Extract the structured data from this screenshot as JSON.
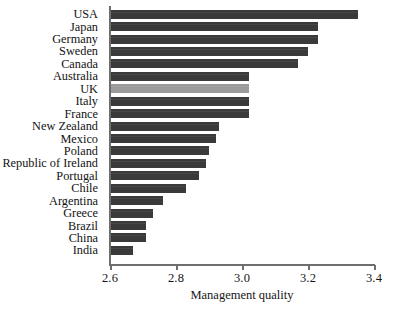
{
  "chart_data": {
    "type": "bar",
    "orientation": "horizontal",
    "title": "",
    "subtitle": "",
    "xlabel": "Management quality",
    "ylabel": "",
    "xlim": [
      2.6,
      3.4
    ],
    "xticks": [
      "2.6",
      "2.8",
      "3.0",
      "3.2",
      "3.4"
    ],
    "xtick_values": [
      2.6,
      2.8,
      3.0,
      3.2,
      3.4
    ],
    "grid": false,
    "legend": "none",
    "bar_color": "#3a3a3a",
    "highlight_color": "#9b9b9b",
    "highlight_category": "UK",
    "axis_color": "#6e6e6e",
    "background_color": "#ffffff",
    "categories": [
      "USA",
      "Japan",
      "Germany",
      "Sweden",
      "Canada",
      "Australia",
      "UK",
      "Italy",
      "France",
      "New Zealand",
      "Mexico",
      "Poland",
      "Republic of Ireland",
      "Portugal",
      "Chile",
      "Argentina",
      "Greece",
      "Brazil",
      "China",
      "India"
    ],
    "values": [
      3.35,
      3.23,
      3.23,
      3.2,
      3.17,
      3.02,
      3.02,
      3.02,
      3.02,
      2.93,
      2.92,
      2.9,
      2.89,
      2.87,
      2.83,
      2.76,
      2.73,
      2.71,
      2.71,
      2.67
    ],
    "bars": [
      {
        "label": "USA",
        "value": 3.35,
        "highlight": false
      },
      {
        "label": "Japan",
        "value": 3.23,
        "highlight": false
      },
      {
        "label": "Germany",
        "value": 3.23,
        "highlight": false
      },
      {
        "label": "Sweden",
        "value": 3.2,
        "highlight": false
      },
      {
        "label": "Canada",
        "value": 3.17,
        "highlight": false
      },
      {
        "label": "Australia",
        "value": 3.02,
        "highlight": false
      },
      {
        "label": "UK",
        "value": 3.02,
        "highlight": true
      },
      {
        "label": "Italy",
        "value": 3.02,
        "highlight": false
      },
      {
        "label": "France",
        "value": 3.02,
        "highlight": false
      },
      {
        "label": "New Zealand",
        "value": 2.93,
        "highlight": false
      },
      {
        "label": "Mexico",
        "value": 2.92,
        "highlight": false
      },
      {
        "label": "Poland",
        "value": 2.9,
        "highlight": false
      },
      {
        "label": "Republic of Ireland",
        "value": 2.89,
        "highlight": false
      },
      {
        "label": "Portugal",
        "value": 2.87,
        "highlight": false
      },
      {
        "label": "Chile",
        "value": 2.83,
        "highlight": false
      },
      {
        "label": "Argentina",
        "value": 2.76,
        "highlight": false
      },
      {
        "label": "Greece",
        "value": 2.73,
        "highlight": false
      },
      {
        "label": "Brazil",
        "value": 2.71,
        "highlight": false
      },
      {
        "label": "China",
        "value": 2.71,
        "highlight": false
      },
      {
        "label": "India",
        "value": 2.67,
        "highlight": false
      }
    ]
  }
}
